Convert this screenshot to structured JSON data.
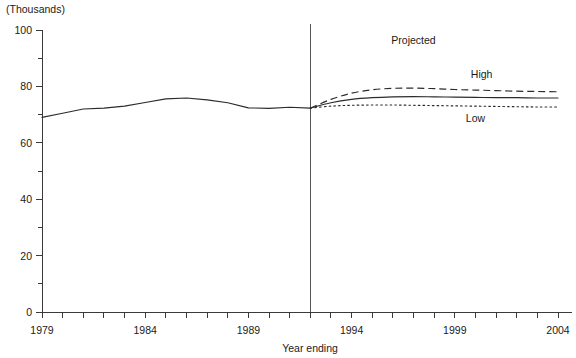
{
  "chart_data": {
    "type": "line",
    "title": "",
    "unit_label": "(Thousands)",
    "xlabel": "Year ending",
    "ylabel": "",
    "xlim": [
      1979,
      2004
    ],
    "ylim": [
      0,
      100
    ],
    "grid": false,
    "legend_position": "inline-right",
    "y_ticks": [
      0,
      20,
      40,
      60,
      80,
      100
    ],
    "y_minor_ticks": [
      10,
      30,
      50,
      70,
      90
    ],
    "x_ticks": [
      1979,
      1980,
      1981,
      1982,
      1983,
      1984,
      1985,
      1986,
      1987,
      1988,
      1989,
      1990,
      1991,
      1992,
      1993,
      1994,
      1995,
      1996,
      1997,
      1998,
      1999,
      2000,
      2001,
      2002,
      2003,
      2004
    ],
    "x_tick_labels": [
      "1979",
      "1984",
      "1989",
      "1994",
      "1999",
      "2004"
    ],
    "x_tick_label_years": [
      1979,
      1984,
      1989,
      1994,
      1999,
      2004
    ],
    "projection_divider_year": 1992,
    "annotations": [
      {
        "text": "Projected",
        "x": 1997.0,
        "y": 95.0
      },
      {
        "text": "High",
        "x": 2000.3,
        "y": 83.0
      },
      {
        "text": "Low",
        "x": 2000.0,
        "y": 67.5
      }
    ],
    "series": [
      {
        "name": "Actual",
        "style": "solid",
        "x": [
          1979,
          1980,
          1981,
          1982,
          1983,
          1984,
          1985,
          1986,
          1987,
          1988,
          1989,
          1990,
          1991,
          1992
        ],
        "values": [
          69.0,
          70.5,
          72.0,
          72.3,
          73.0,
          74.3,
          75.6,
          75.9,
          75.2,
          74.2,
          72.4,
          72.2,
          72.6,
          72.3
        ]
      },
      {
        "name": "High",
        "style": "dashed",
        "x": [
          1992,
          1993,
          1994,
          1995,
          1996,
          1997,
          1998,
          1999,
          2000,
          2001,
          2002,
          2003,
          2004
        ],
        "values": [
          72.3,
          75.4,
          77.6,
          78.8,
          79.3,
          79.4,
          79.2,
          78.9,
          78.7,
          78.5,
          78.3,
          78.2,
          78.1
        ]
      },
      {
        "name": "Middle",
        "style": "solid",
        "x": [
          1992,
          1993,
          1994,
          1995,
          1996,
          1997,
          1998,
          1999,
          2000,
          2001,
          2002,
          2003,
          2004
        ],
        "values": [
          72.3,
          74.2,
          75.4,
          76.0,
          76.3,
          76.4,
          76.3,
          76.2,
          76.1,
          76.0,
          76.0,
          75.9,
          75.9
        ]
      },
      {
        "name": "Low",
        "style": "dotted",
        "x": [
          1992,
          1993,
          1994,
          1995,
          1996,
          1997,
          1998,
          1999,
          2000,
          2001,
          2002,
          2003,
          2004
        ],
        "values": [
          72.3,
          73.0,
          73.3,
          73.4,
          73.4,
          73.3,
          73.2,
          73.1,
          73.0,
          72.9,
          72.8,
          72.7,
          72.7
        ]
      }
    ]
  },
  "colors": {
    "line": "#2b2b2b",
    "axis": "#3a3a3a",
    "divider": "#555555",
    "text": "#1a1a1a",
    "background": "#ffffff"
  }
}
